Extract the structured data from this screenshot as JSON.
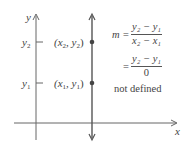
{
  "diagram": {
    "axes": {
      "x_label": "x",
      "y_label": "y"
    },
    "y_ticks": [
      {
        "label": "y",
        "sub": "2"
      },
      {
        "label": "y",
        "sub": "1"
      }
    ],
    "points": [
      {
        "label": "(x",
        "sub1": "2",
        "mid": ", y",
        "sub2": "2",
        "end": ")"
      },
      {
        "label": "(x",
        "sub1": "1",
        "mid": ", y",
        "sub2": "1",
        "end": ")"
      }
    ],
    "equation": {
      "lhs": "m =",
      "line1_num": "y₂ − y₁",
      "line1_den": "x₂ − x₁",
      "line2_eq": "=",
      "line2_num": "y₂ − y₁",
      "line2_den": "0",
      "conclusion": "not defined"
    },
    "colors": {
      "line": "#555555",
      "point": "#444444",
      "text": "#444444"
    }
  }
}
